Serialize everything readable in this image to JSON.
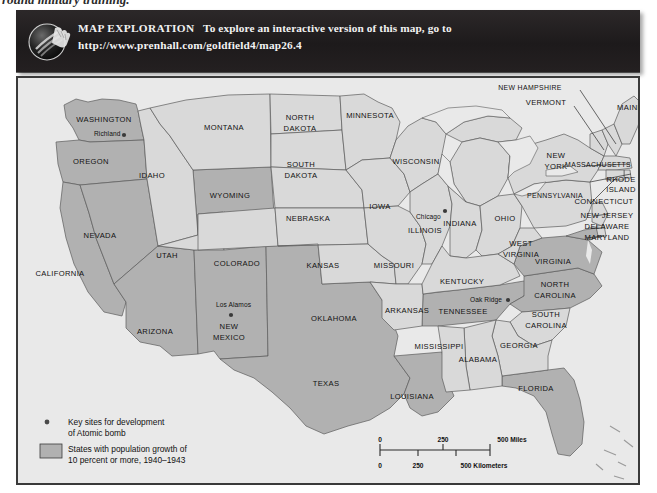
{
  "page": {
    "top_caption": "round military training.",
    "background": "#ffffff"
  },
  "banner": {
    "icon": "hand-globe-icon",
    "title": "MAP EXPLORATION",
    "line1_rest": "To explore an interactive version of this map, go to",
    "url": "http://www.prenhall.com/goldfield4/map26.4",
    "background": "#231f20",
    "text_color": "#f2f2f2"
  },
  "map": {
    "frame_border": "#3a3a3a",
    "ocean_color": "#e9e9e9",
    "state_fill": "#d9d9d9",
    "highlight_fill": "#b1b1b1",
    "stroke": "#5b5b5b",
    "state_labels": [
      {
        "name": "WASHINGTON",
        "x": 86,
        "y": 44,
        "highlight": true
      },
      {
        "name": "OREGON",
        "x": 73,
        "y": 86,
        "highlight": true
      },
      {
        "name": "IDAHO",
        "x": 134,
        "y": 100,
        "highlight": false
      },
      {
        "name": "MONTANA",
        "x": 206,
        "y": 52,
        "highlight": false
      },
      {
        "name": "WYOMING",
        "x": 212,
        "y": 120,
        "highlight": true
      },
      {
        "name": "NEVADA",
        "x": 82,
        "y": 160,
        "highlight": true
      },
      {
        "name": "UTAH",
        "x": 149,
        "y": 180,
        "highlight": false
      },
      {
        "name": "COLORADO",
        "x": 219,
        "y": 188,
        "highlight": false
      },
      {
        "name": "CALIFORNIA",
        "x": 42,
        "y": 198,
        "highlight": true
      },
      {
        "name": "ARIZONA",
        "x": 137,
        "y": 256,
        "highlight": true
      },
      {
        "name": "NEW",
        "x": 211,
        "y": 251,
        "highlight": true
      },
      {
        "name": "MEXICO",
        "x": 211,
        "y": 262,
        "highlight": true
      },
      {
        "name": "NORTH",
        "x": 282,
        "y": 42,
        "highlight": false
      },
      {
        "name": "DAKOTA",
        "x": 282,
        "y": 53,
        "highlight": false
      },
      {
        "name": "SOUTH",
        "x": 283,
        "y": 89,
        "highlight": false
      },
      {
        "name": "DAKOTA",
        "x": 283,
        "y": 100,
        "highlight": false
      },
      {
        "name": "MINNESOTA",
        "x": 352,
        "y": 40,
        "highlight": false
      },
      {
        "name": "WISCONSIN",
        "x": 398,
        "y": 86,
        "highlight": false
      },
      {
        "name": "IOWA",
        "x": 362,
        "y": 131,
        "highlight": false
      },
      {
        "name": "NEBRASKA",
        "x": 290,
        "y": 143,
        "highlight": false
      },
      {
        "name": "KANSAS",
        "x": 305,
        "y": 190,
        "highlight": false
      },
      {
        "name": "MISSOURI",
        "x": 376,
        "y": 190,
        "highlight": false
      },
      {
        "name": "ILLINOIS",
        "x": 407,
        "y": 155,
        "highlight": false
      },
      {
        "name": "INDIANA",
        "x": 442,
        "y": 148,
        "highlight": false
      },
      {
        "name": "OHIO",
        "x": 487,
        "y": 143,
        "highlight": false
      },
      {
        "name": "KENTUCKY",
        "x": 444,
        "y": 206,
        "highlight": false
      },
      {
        "name": "TENNESSEE",
        "x": 445,
        "y": 236,
        "highlight": true
      },
      {
        "name": "ARKANSAS",
        "x": 389,
        "y": 235,
        "highlight": false
      },
      {
        "name": "OKLAHOMA",
        "x": 316,
        "y": 243,
        "highlight": false
      },
      {
        "name": "TEXAS",
        "x": 308,
        "y": 308,
        "highlight": true
      },
      {
        "name": "LOUISIANA",
        "x": 394,
        "y": 321,
        "highlight": true
      },
      {
        "name": "MISSISSIPPI",
        "x": 421,
        "y": 271,
        "highlight": false
      },
      {
        "name": "ALABAMA",
        "x": 460,
        "y": 284,
        "highlight": false
      },
      {
        "name": "GEORGIA",
        "x": 501,
        "y": 270,
        "highlight": false
      },
      {
        "name": "FLORIDA",
        "x": 518,
        "y": 313,
        "highlight": true
      },
      {
        "name": "SOUTH",
        "x": 528,
        "y": 239,
        "highlight": false
      },
      {
        "name": "CAROLINA",
        "x": 528,
        "y": 250,
        "highlight": false
      },
      {
        "name": "NORTH",
        "x": 537,
        "y": 209,
        "highlight": true
      },
      {
        "name": "CAROLINA",
        "x": 537,
        "y": 220,
        "highlight": true
      },
      {
        "name": "VIRGINIA",
        "x": 535,
        "y": 186,
        "highlight": true
      },
      {
        "name": "WEST",
        "x": 503,
        "y": 168,
        "highlight": false
      },
      {
        "name": "VIRGINIA",
        "x": 503,
        "y": 179,
        "highlight": false
      },
      {
        "name": "PENNSYLVANIA",
        "x": 537,
        "y": 120,
        "highlight": false
      },
      {
        "name": "NEW",
        "x": 538,
        "y": 80,
        "highlight": false
      },
      {
        "name": "YORK",
        "x": 538,
        "y": 91,
        "highlight": false
      },
      {
        "name": "MAINE",
        "x": 612,
        "y": 32,
        "highlight": false
      },
      {
        "name": "VERMONT",
        "x": 528,
        "y": 27,
        "highlight": false
      },
      {
        "name": "NEW HAMPSHIRE",
        "x": 512,
        "y": 12,
        "highlight": false
      },
      {
        "name": "MASSACHUSETTS",
        "x": 580,
        "y": 89,
        "highlight": false
      },
      {
        "name": "RHODE",
        "x": 603,
        "y": 104,
        "highlight": false
      },
      {
        "name": "ISLAND",
        "x": 603,
        "y": 114,
        "highlight": false
      },
      {
        "name": "CONNECTICUT",
        "x": 586,
        "y": 126,
        "highlight": false
      },
      {
        "name": "NEW JERSEY",
        "x": 589,
        "y": 140,
        "highlight": false
      },
      {
        "name": "DELAWARE",
        "x": 589,
        "y": 151,
        "highlight": false
      },
      {
        "name": "MARYLAND",
        "x": 589,
        "y": 162,
        "highlight": false
      }
    ],
    "city_sites": [
      {
        "name": "Richland",
        "label_x": 76,
        "label_y": 58,
        "dot_x": 106,
        "dot_y": 57
      },
      {
        "name": "Los Alamos",
        "label_x": 198,
        "label_y": 229,
        "dot_x": 213,
        "dot_y": 237
      },
      {
        "name": "Oak Ridge",
        "label_x": 452,
        "label_y": 224,
        "dot_x": 490,
        "dot_y": 222
      },
      {
        "name": "Chicago",
        "label_x": 398,
        "label_y": 141,
        "dot_x": 427,
        "dot_y": 133
      }
    ]
  },
  "legend": {
    "site_marker_label_line1": "Key sites for development",
    "site_marker_label_line2": "of Atomic bomb",
    "swatch_label_line1": "States with population growth of",
    "swatch_label_line2": "10 percent or more, 1940–1943",
    "swatch_color": "#b1b1b1"
  },
  "scale_bar": {
    "miles_ticks": [
      "0",
      "250",
      "500 Miles"
    ],
    "kilometers_ticks": [
      "0",
      "250",
      "500 Kilometers"
    ]
  }
}
